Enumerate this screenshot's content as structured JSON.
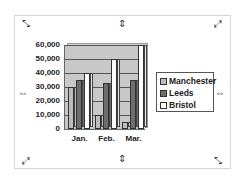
{
  "chart_data": {
    "type": "bar",
    "style": "3d-clustered-column",
    "title": "",
    "xlabel": "",
    "ylabel": "",
    "categories": [
      "Jan.",
      "Feb.",
      "Mar."
    ],
    "series": [
      {
        "name": "Manchester",
        "values": [
          30000,
          10000,
          5000
        ],
        "color": "#bdbdbd"
      },
      {
        "name": "Leeds",
        "values": [
          35000,
          33000,
          35000
        ],
        "color": "#6e6e6e"
      },
      {
        "name": "Bristol",
        "values": [
          40000,
          50000,
          60000
        ],
        "color": "#ffffff"
      }
    ],
    "ylim": [
      0,
      60000
    ],
    "yticks": [
      "0",
      "10,000",
      "20,000",
      "30,000",
      "40,000",
      "50,000",
      "60,000"
    ],
    "grid": true,
    "legend_position": "right"
  },
  "handles": {
    "corner": "resize-diagonal-icon",
    "edge_vertical": "resize-vertical-icon",
    "edge_horizontal": "resize-horizontal-icon"
  }
}
